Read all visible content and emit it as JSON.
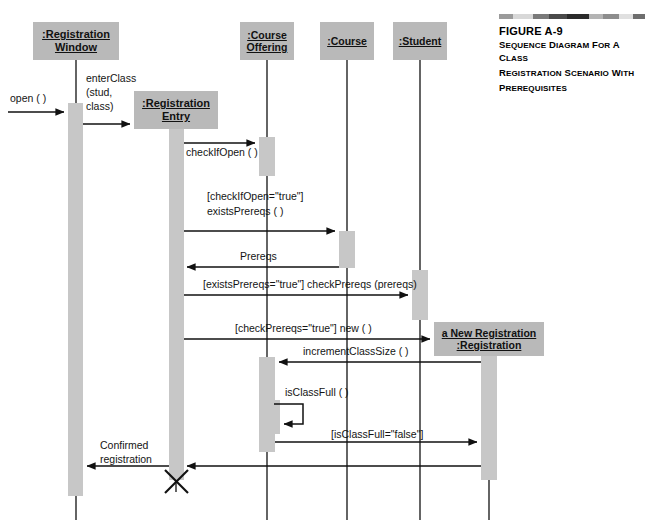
{
  "figure": {
    "number": "FIGURE A-9",
    "caption_lines": [
      "Sequence Diagram for a Class",
      "Registration Scenario with",
      "Prerequisites"
    ],
    "bar_colors": [
      "#9b9b9b",
      "#d8d8d8",
      "#7a7a7a",
      "#4a4a4a",
      "#2b2b2b",
      "#b4b4b4",
      "#8d8d8d",
      "#e0e0e0",
      "#6e6e6e"
    ]
  },
  "colors": {
    "object_box_fill": "#b9b9b9",
    "activation_fill": "#c7c7c7",
    "line": "#111111",
    "page_background": "#ffffff"
  },
  "diagram": {
    "type": "uml-sequence-diagram",
    "objects": [
      {
        "id": "registration_window",
        "line1": ":Registration",
        "line2": "Window",
        "x": 33,
        "y": 22,
        "w": 86,
        "h": 38,
        "lifeline_x": 76
      },
      {
        "id": "registration_entry",
        "line1": ":Registration",
        "line2": "Entry",
        "x": 134,
        "y": 91,
        "w": 84,
        "h": 38,
        "lifeline_x": 176
      },
      {
        "id": "course_offering",
        "line1": ":Course",
        "line2": "Offering",
        "x": 240,
        "y": 22,
        "w": 54,
        "h": 38,
        "lifeline_x": 267
      },
      {
        "id": "course",
        "line1": ":Course",
        "line2": "",
        "x": 320,
        "y": 22,
        "w": 54,
        "h": 38,
        "lifeline_x": 347
      },
      {
        "id": "student",
        "line1": ":Student",
        "line2": "",
        "x": 393,
        "y": 22,
        "w": 54,
        "h": 38,
        "lifeline_x": 420
      },
      {
        "id": "new_registration",
        "line1": "a New Registration",
        "line2": ":Registration",
        "x": 434,
        "y": 322,
        "w": 110,
        "h": 34,
        "lifeline_x": 489
      }
    ],
    "messages": [
      {
        "id": "open",
        "label": "open ( )",
        "from": "actor",
        "to": "registration_window",
        "y": 112
      },
      {
        "id": "enter_class",
        "label": "enterClass\n(stud,\nclass)",
        "from": "registration_window",
        "to": "registration_entry",
        "y": 124
      },
      {
        "id": "check_if_open",
        "label": "checkIfOpen ( )",
        "from": "registration_entry",
        "to": "course_offering",
        "y": 143
      },
      {
        "id": "exists_prereqs",
        "label": "[checkIfOpen=\"true\"]\nexistsPrereqs ( )",
        "from": "registration_entry",
        "to": "course",
        "y": 219
      },
      {
        "id": "prereqs_return",
        "label": "Prereqs",
        "from": "course",
        "to": "registration_entry",
        "y": 247
      },
      {
        "id": "check_prereqs",
        "label": "[existsPrereqs=\"true\"] checkPrereqs (prereqs)",
        "from": "registration_entry",
        "to": "student",
        "y": 283
      },
      {
        "id": "new",
        "label": "[checkPrereqs=\"true\"] new ( )",
        "from": "registration_entry",
        "to": "new_registration",
        "y": 339
      },
      {
        "id": "increment_class_size",
        "label": "incrementClassSize ( )",
        "from": "new_registration",
        "to": "course_offering",
        "y": 362
      },
      {
        "id": "is_class_full",
        "label": "isClassFull ( )",
        "from": "course_offering",
        "to": "course_offering",
        "y": 399
      },
      {
        "id": "is_class_full_false",
        "label": "[isClassFull=\"false\"]",
        "from": "course_offering",
        "to": "new_registration",
        "y": 442
      },
      {
        "id": "registration_return",
        "label": "",
        "from": "new_registration",
        "to": "registration_entry",
        "y": 466
      },
      {
        "id": "confirmed",
        "label": "Confirmed\nregistration",
        "from": "registration_entry",
        "to": "registration_window",
        "y": 466
      }
    ],
    "labels": {
      "open": "open ( )",
      "enter_class_l1": "enterClass",
      "enter_class_l2": "(stud,",
      "enter_class_l3": "class)",
      "check_if_open": "checkIfOpen ( )",
      "guard_check_if_open": "[checkIfOpen=\"true\"]",
      "exists_prereqs": "existsPrereqs ( )",
      "prereqs": "Prereqs",
      "check_prereqs": "[existsPrereqs=\"true\"] checkPrereqs (prereqs)",
      "new_call": "[checkPrereqs=\"true\"] new ( )",
      "increment_class_size": "incrementClassSize ( )",
      "is_class_full": "isClassFull ( )",
      "is_class_full_false": "[isClassFull=\"false\"]",
      "confirmed_l1": "Confirmed",
      "confirmed_l2": "registration"
    },
    "destruction_marker": {
      "object": "registration_entry",
      "x": 176,
      "y": 481,
      "size": 11
    }
  }
}
